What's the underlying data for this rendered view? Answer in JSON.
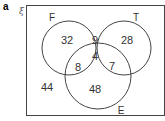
{
  "part_label": "a",
  "universal_symbol": "ξ",
  "sets": {
    "F": "F",
    "T": "T",
    "E": "E"
  },
  "regions": {
    "F_only": "32",
    "F_and_T_only": "9",
    "T_only": "28",
    "F_and_E_only": "8",
    "F_T_E": "4",
    "T_and_E_only": "7",
    "E_only": "48",
    "outside": "44"
  }
}
